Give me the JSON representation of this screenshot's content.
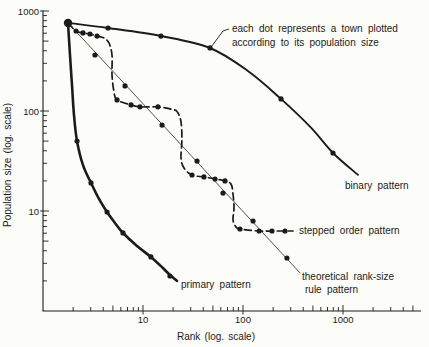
{
  "figure": {
    "background": "#fcfcf9",
    "ink": "#1b1b1b",
    "thin_line_color": "#3d3d3d"
  },
  "annotation": {
    "line1": "each dot represents a town plotted",
    "line2": "according to its population size"
  },
  "chart_data": {
    "type": "line",
    "x_scale": "log",
    "y_scale": "log",
    "xlabel": "Rank (log. scale)",
    "ylabel": "Population size (log. scale)",
    "x_ticks": [
      10,
      100,
      1000
    ],
    "y_ticks": [
      1000,
      100,
      10
    ],
    "xlim": [
      1,
      5900
    ],
    "ylim": [
      1,
      1000
    ],
    "grid": false,
    "legend_position": "inline-labels",
    "start_point": {
      "rank": 1.78,
      "population": 760
    },
    "series": [
      {
        "name": "theoretical rank-size rule pattern",
        "style": "thin",
        "label_lines": [
          "theoretical rank-size",
          "rule pattern"
        ],
        "label_xy": [
          [
            302,
            280
          ],
          [
            305,
            293
          ]
        ],
        "path": [
          [
            1.78,
            760
          ],
          [
            372,
            2.4
          ]
        ],
        "towns": [
          [
            3.31,
            363
          ],
          [
            6.61,
            178
          ],
          [
            15.5,
            72.4
          ],
          [
            34.7,
            31.6
          ],
          [
            63.1,
            15.1
          ],
          [
            126,
            7.94
          ],
          [
            275,
            3.39
          ]
        ]
      },
      {
        "name": "binary pattern",
        "style": "solid",
        "label_lines": [
          "binary pattern"
        ],
        "label_xy": [
          [
            345,
            189
          ]
        ],
        "path": [
          [
            1.78,
            760
          ],
          [
            4.47,
            676
          ],
          [
            15.1,
            562
          ],
          [
            46.8,
            427
          ],
          [
            112,
            251
          ],
          [
            240,
            132
          ],
          [
            479,
            68
          ],
          [
            794,
            38
          ],
          [
            1410,
            23
          ]
        ],
        "towns": [
          [
            4.47,
            676
          ],
          [
            15.1,
            562
          ],
          [
            46.8,
            427
          ],
          [
            240,
            132
          ],
          [
            794,
            38
          ]
        ]
      },
      {
        "name": "stepped order pattern",
        "style": "dashed",
        "label_lines": [
          "stepped order pattern"
        ],
        "label_xy": [
          [
            299,
            234
          ]
        ],
        "path": [
          [
            1.78,
            760
          ],
          [
            2.14,
            631
          ],
          [
            2.51,
            603
          ],
          [
            2.95,
            589
          ],
          [
            3.47,
            562
          ],
          [
            4.07,
            537
          ],
          [
            4.57,
            479
          ],
          [
            4.9,
            363
          ],
          [
            4.9,
            229
          ],
          [
            5.13,
            155
          ],
          [
            5.5,
            129
          ],
          [
            7.59,
            115
          ],
          [
            9.33,
            110
          ],
          [
            14.1,
            110
          ],
          [
            18.6,
            105
          ],
          [
            21.9,
            98.9
          ],
          [
            24,
            77.6
          ],
          [
            24.5,
            51.3
          ],
          [
            24,
            33.9
          ],
          [
            25.7,
            26.9
          ],
          [
            30.9,
            22.9
          ],
          [
            40.7,
            21.9
          ],
          [
            52.5,
            20.9
          ],
          [
            66.1,
            20
          ],
          [
            75.9,
            18.6
          ],
          [
            79.4,
            14.8
          ],
          [
            81.3,
            10.7
          ],
          [
            79.4,
            8.13
          ],
          [
            85.1,
            6.92
          ],
          [
            93.3,
            6.61
          ],
          [
            145,
            6.31
          ],
          [
            195,
            6.31
          ],
          [
            263,
            6.31
          ],
          [
            316,
            6.31
          ]
        ],
        "towns": [
          [
            2.14,
            631
          ],
          [
            2.51,
            603
          ],
          [
            2.95,
            589
          ],
          [
            3.47,
            562
          ],
          [
            5.5,
            129
          ],
          [
            7.59,
            115
          ],
          [
            9.33,
            110
          ],
          [
            14.1,
            110
          ],
          [
            30.9,
            22.9
          ],
          [
            40.7,
            21.9
          ],
          [
            52.5,
            20.9
          ],
          [
            66.1,
            20
          ],
          [
            93.3,
            6.61
          ],
          [
            145,
            6.31
          ],
          [
            195,
            6.31
          ],
          [
            263,
            6.31
          ]
        ]
      },
      {
        "name": "primary pattern",
        "style": "thick",
        "label_lines": [
          "primary pattern"
        ],
        "label_xy": [
          [
            181,
            288
          ]
        ],
        "path": [
          [
            1.78,
            760
          ],
          [
            1.86,
            363
          ],
          [
            1.95,
            182
          ],
          [
            2.04,
            91.2
          ],
          [
            2.19,
            50.1
          ],
          [
            2.51,
            28.8
          ],
          [
            3.02,
            19.1
          ],
          [
            3.63,
            13.2
          ],
          [
            4.37,
            9.77
          ],
          [
            5.25,
            7.59
          ],
          [
            6.31,
            6.03
          ],
          [
            8.71,
            4.47
          ],
          [
            12,
            3.47
          ],
          [
            15.8,
            2.69
          ],
          [
            18.6,
            2.29
          ],
          [
            21.9,
            2
          ]
        ],
        "towns": [
          [
            2.19,
            50.1
          ],
          [
            3.02,
            19.1
          ],
          [
            4.37,
            9.77
          ],
          [
            6.31,
            6.03
          ],
          [
            12,
            3.47
          ],
          [
            18.6,
            2.24
          ]
        ]
      }
    ]
  }
}
